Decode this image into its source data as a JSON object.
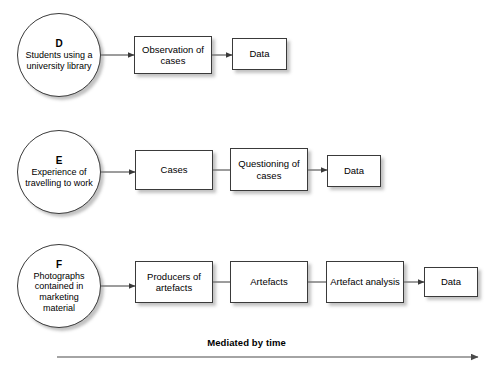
{
  "diagram": {
    "title": "Mediated by time",
    "stroke_color": "#3a3a3a",
    "arrow_color": "#4a4a4a",
    "background_color": "#ffffff",
    "timeline": {
      "label": "Mediated by time",
      "arrow_start_x": 57,
      "arrow_end_x": 478,
      "arrow_y": 357
    },
    "rows": [
      {
        "id": "row-d",
        "letter": "D",
        "source": {
          "letter": "D",
          "text": "Students using a university library",
          "cx": 59,
          "cy": 55,
          "r": 42
        },
        "steps": [
          {
            "label": "Observation of cases",
            "x": 134,
            "y": 36,
            "w": 78,
            "h": 38,
            "connector": "arrow"
          },
          {
            "label": "Data",
            "x": 232,
            "y": 38,
            "w": 55,
            "h": 32,
            "connector": "arrow"
          }
        ]
      },
      {
        "id": "row-e",
        "letter": "E",
        "source": {
          "letter": "E",
          "text": "Experience of travelling to work",
          "cx": 59,
          "cy": 172,
          "r": 42
        },
        "steps": [
          {
            "label": "Cases",
            "x": 135,
            "y": 150,
            "w": 78,
            "h": 40,
            "connector": "arrow"
          },
          {
            "label": "Questioning of cases",
            "x": 230,
            "y": 148,
            "w": 78,
            "h": 43,
            "connector": "line"
          },
          {
            "label": "Data",
            "x": 327,
            "y": 155,
            "w": 54,
            "h": 32,
            "connector": "arrow"
          }
        ]
      },
      {
        "id": "row-f",
        "letter": "F",
        "source": {
          "letter": "F",
          "text": "Photographs contained in marketing material",
          "cx": 59,
          "cy": 286,
          "r": 42
        },
        "steps": [
          {
            "label": "Producers of artefacts",
            "x": 135,
            "y": 261,
            "w": 78,
            "h": 42,
            "connector": "arrow"
          },
          {
            "label": "Artefacts",
            "x": 230,
            "y": 261,
            "w": 78,
            "h": 42,
            "connector": "line"
          },
          {
            "label": "Artefact analysis",
            "x": 326,
            "y": 261,
            "w": 78,
            "h": 42,
            "connector": "line"
          },
          {
            "label": "Data",
            "x": 424,
            "y": 267,
            "w": 54,
            "h": 30,
            "connector": "arrow"
          }
        ]
      }
    ]
  }
}
